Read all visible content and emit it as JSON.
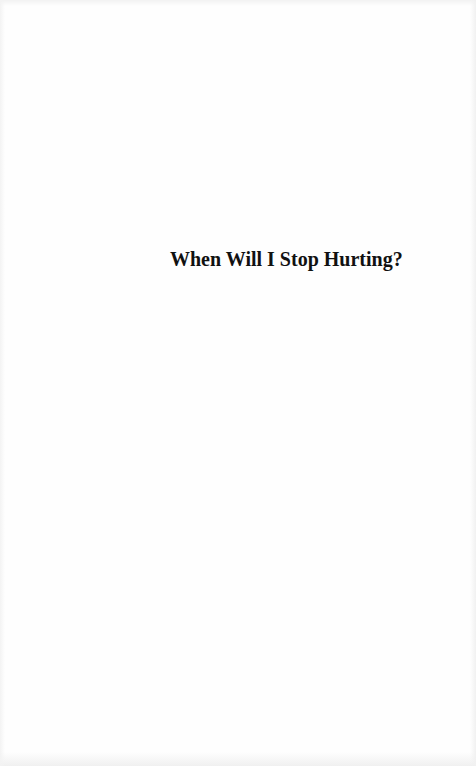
{
  "document": {
    "type": "half-title page",
    "title": "When Will I Stop Hurting?"
  },
  "colors": {
    "page_background": "#fefefe",
    "text": "#111111"
  }
}
